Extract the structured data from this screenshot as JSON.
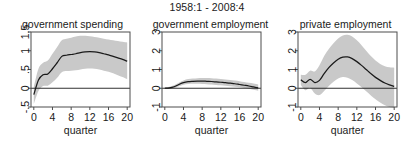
{
  "figure": {
    "title": "1958:1 - 2008:4",
    "background_color": "#ffffff",
    "line_color": "#1a1a1a",
    "band_color": "#c9c9c9",
    "axis_color": "#4d4d4d"
  },
  "chart_data": [
    {
      "type": "line",
      "title": "government spending",
      "xlabel": "quarter",
      "ylabel": "",
      "xlim": [
        -0.6,
        20.6
      ],
      "ylim": [
        -0.5,
        1.5
      ],
      "xticks": [
        0,
        4,
        8,
        12,
        16,
        20
      ],
      "xticklabels": [
        "0",
        "4",
        "8",
        "12",
        "16",
        "20"
      ],
      "yticks": [
        -0.5,
        0,
        0.5,
        1,
        1.5
      ],
      "yticklabels": [
        "-.5",
        "0",
        ".5",
        "1",
        "1.5"
      ],
      "grid": false,
      "legend": null,
      "zero_line": 0,
      "x": [
        0,
        1,
        2,
        3,
        4,
        5,
        6,
        7,
        8,
        9,
        10,
        11,
        12,
        13,
        14,
        15,
        16,
        17,
        18,
        19,
        20
      ],
      "series": [
        {
          "name": "impulse response",
          "values": [
            -0.17,
            0.22,
            0.36,
            0.38,
            0.52,
            0.68,
            0.85,
            0.88,
            0.9,
            0.92,
            0.95,
            0.97,
            0.98,
            0.97,
            0.95,
            0.92,
            0.89,
            0.85,
            0.81,
            0.77,
            0.72
          ]
        },
        {
          "name": "confidence band upper",
          "values": [
            0.04,
            0.52,
            0.68,
            0.74,
            0.92,
            1.1,
            1.28,
            1.32,
            1.35,
            1.38,
            1.4,
            1.4,
            1.39,
            1.37,
            1.35,
            1.32,
            1.3,
            1.28,
            1.26,
            1.24,
            1.22
          ]
        },
        {
          "name": "confidence band lower",
          "values": [
            -0.42,
            -0.07,
            0.06,
            0.07,
            0.16,
            0.28,
            0.43,
            0.46,
            0.47,
            0.48,
            0.5,
            0.52,
            0.53,
            0.52,
            0.5,
            0.47,
            0.44,
            0.4,
            0.35,
            0.3,
            0.24
          ]
        }
      ]
    },
    {
      "type": "line",
      "title": "government employment",
      "xlabel": "quarter",
      "ylabel": "",
      "xlim": [
        -0.6,
        20.6
      ],
      "ylim": [
        -1,
        3
      ],
      "xticks": [
        0,
        4,
        8,
        12,
        16,
        20
      ],
      "xticklabels": [
        "0",
        "4",
        "8",
        "12",
        "16",
        "20"
      ],
      "yticks": [
        -1,
        0,
        1,
        2,
        3
      ],
      "yticklabels": [
        "-1",
        "0",
        "1",
        "2",
        "3"
      ],
      "grid": false,
      "legend": null,
      "zero_line": 0,
      "x": [
        0,
        1,
        2,
        3,
        4,
        5,
        6,
        7,
        8,
        9,
        10,
        11,
        12,
        13,
        14,
        15,
        16,
        17,
        18,
        19,
        20
      ],
      "series": [
        {
          "name": "impulse response",
          "values": [
            0.0,
            0.02,
            0.08,
            0.2,
            0.3,
            0.35,
            0.37,
            0.38,
            0.38,
            0.37,
            0.36,
            0.34,
            0.32,
            0.3,
            0.27,
            0.24,
            0.2,
            0.16,
            0.12,
            0.07,
            0.02
          ]
        },
        {
          "name": "confidence band upper",
          "values": [
            0.03,
            0.08,
            0.16,
            0.3,
            0.42,
            0.49,
            0.52,
            0.54,
            0.55,
            0.55,
            0.54,
            0.52,
            0.5,
            0.47,
            0.44,
            0.41,
            0.37,
            0.33,
            0.29,
            0.25,
            0.2
          ]
        },
        {
          "name": "confidence band lower",
          "values": [
            -0.03,
            -0.02,
            0.01,
            0.11,
            0.19,
            0.23,
            0.24,
            0.24,
            0.23,
            0.22,
            0.2,
            0.18,
            0.16,
            0.13,
            0.11,
            0.08,
            0.05,
            0.01,
            -0.03,
            -0.08,
            -0.13
          ]
        }
      ]
    },
    {
      "type": "line",
      "title": "private employment",
      "xlabel": "quarter",
      "ylabel": "",
      "xlim": [
        -0.6,
        20.6
      ],
      "ylim": [
        -1,
        3
      ],
      "xticks": [
        0,
        4,
        8,
        12,
        16,
        20
      ],
      "xticklabels": [
        "0",
        "4",
        "8",
        "12",
        "16",
        "20"
      ],
      "yticks": [
        -1,
        0,
        1,
        2,
        3
      ],
      "yticklabels": [
        "-1",
        "0",
        "1",
        "2",
        "3"
      ],
      "grid": false,
      "legend": null,
      "zero_line": 0,
      "x": [
        0,
        1,
        2,
        3,
        4,
        5,
        6,
        7,
        8,
        9,
        10,
        11,
        12,
        13,
        14,
        15,
        16,
        17,
        18,
        19,
        20
      ],
      "series": [
        {
          "name": "impulse response",
          "values": [
            0.45,
            0.3,
            0.48,
            0.3,
            0.42,
            0.78,
            1.1,
            1.35,
            1.55,
            1.66,
            1.67,
            1.58,
            1.42,
            1.22,
            1.0,
            0.78,
            0.58,
            0.42,
            0.28,
            0.18,
            0.1
          ]
        },
        {
          "name": "confidence band upper",
          "values": [
            0.72,
            0.72,
            0.94,
            0.9,
            1.23,
            1.72,
            2.1,
            2.4,
            2.66,
            2.82,
            2.85,
            2.76,
            2.56,
            2.3,
            2.0,
            1.72,
            1.48,
            1.3,
            1.18,
            1.12,
            1.1
          ]
        },
        {
          "name": "confidence band lower",
          "values": [
            0.18,
            -0.1,
            0.02,
            -0.28,
            -0.36,
            -0.14,
            0.12,
            0.35,
            0.52,
            0.6,
            0.56,
            0.44,
            0.26,
            0.06,
            -0.16,
            -0.38,
            -0.58,
            -0.76,
            -0.9,
            -1.0,
            -1.05
          ]
        }
      ]
    }
  ]
}
